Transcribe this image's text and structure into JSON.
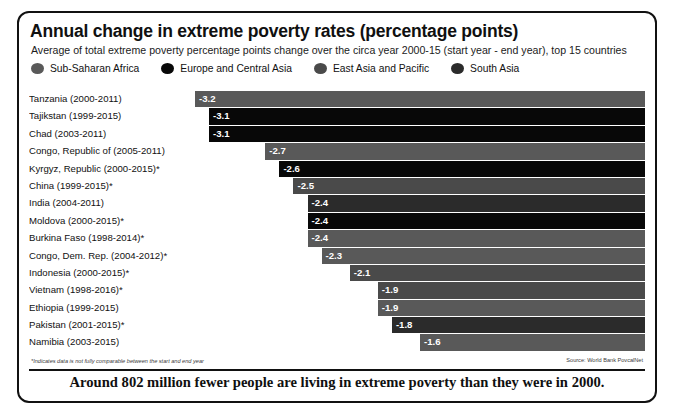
{
  "header": {
    "title": "Annual change in extreme poverty rates (percentage points)",
    "subtitle": "Average of total extreme poverty percentage points change over the circa year 2000-15 (start year - end year), top 15 countries"
  },
  "legend": [
    {
      "label": "Sub-Saharan Africa",
      "color": "#595959",
      "icon": "circle-swatch"
    },
    {
      "label": "Europe and Central Asia",
      "color": "#080808",
      "icon": "circle-swatch"
    },
    {
      "label": "East Asia and Pacific",
      "color": "#4a4a4a",
      "icon": "circle-swatch"
    },
    {
      "label": "South Asia",
      "color": "#2b2b2b",
      "icon": "circle-swatch"
    }
  ],
  "footnote": "*Indicates data is not fully comparable between the start and end year",
  "source": "Source: World Bank PovcalNet",
  "banner": "Around 802 million fewer people are living in extreme poverty than they were in 2000.",
  "chart_data": {
    "type": "bar",
    "orientation": "horizontal",
    "title": "Annual change in extreme poverty rates (percentage points)",
    "subtitle": "Average of total extreme poverty percentage points change over the circa year 2000-15 (start year - end year), top 15 countries",
    "xlabel": "",
    "ylabel": "",
    "xlim": [
      -3.2,
      0
    ],
    "grid": false,
    "legend_position": "top",
    "value_labels": true,
    "categories": [
      "Tanzania (2000-2011)",
      "Tajikstan (1999-2015)",
      "Chad (2003-2011)",
      "Congo, Republic of (2005-2011)",
      "Kyrgyz, Republic (2000-2015)*",
      "China (1999-2015)*",
      "India (2004-2011)",
      "Moldova (2000-2015)*",
      "Burkina Faso (1998-2014)*",
      "Congo, Dem. Rep. (2004-2012)*",
      "Indonesia (2000-2015)*",
      "Vietnam (1998-2016)*",
      "Ethiopia (1999-2015)",
      "Pakistan (2001-2015)*",
      "Namibia (2003-2015)"
    ],
    "values": [
      -3.2,
      -3.1,
      -3.1,
      -2.7,
      -2.6,
      -2.5,
      -2.4,
      -2.4,
      -2.4,
      -2.3,
      -2.1,
      -1.9,
      -1.9,
      -1.8,
      -1.6
    ],
    "value_text": [
      "-3.2",
      "-3.1",
      "-3.1",
      "-2.7",
      "-2.6",
      "-2.5",
      "-2.4",
      "-2.4",
      "-2.4",
      "-2.3",
      "-2.1",
      "-1.9",
      "-1.9",
      "-1.8",
      "-1.6"
    ],
    "regions": [
      "Sub-Saharan Africa",
      "Europe and Central Asia",
      "Europe and Central Asia",
      "Sub-Saharan Africa",
      "Europe and Central Asia",
      "East Asia and Pacific",
      "South Asia",
      "Europe and Central Asia",
      "Sub-Saharan Africa",
      "Sub-Saharan Africa",
      "East Asia and Pacific",
      "East Asia and Pacific",
      "Sub-Saharan Africa",
      "South Asia",
      "Sub-Saharan Africa"
    ],
    "bar_colors": [
      "#595959",
      "#080808",
      "#080808",
      "#595959",
      "#080808",
      "#4a4a4a",
      "#2b2b2b",
      "#080808",
      "#595959",
      "#595959",
      "#4a4a4a",
      "#4a4a4a",
      "#595959",
      "#2b2b2b",
      "#595959"
    ]
  }
}
